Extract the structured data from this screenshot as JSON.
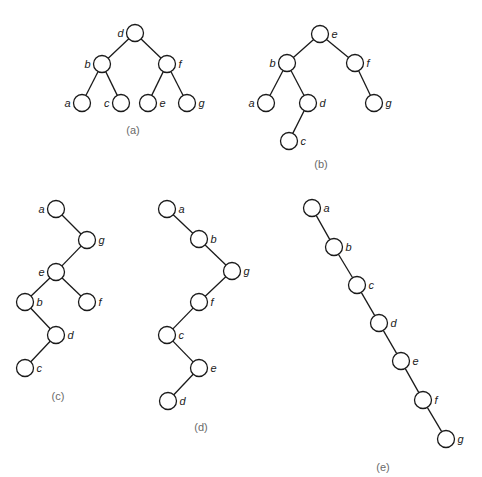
{
  "figure": {
    "node_radius": 8.5,
    "stroke_color": "#1a1a1a",
    "caption_color": "#6a6a6a",
    "trees": [
      {
        "id": "a",
        "caption": "(a)",
        "caption_pos": [
          133,
          134
        ],
        "nodes": [
          {
            "key": "d",
            "x": 135,
            "y": 33,
            "label_side": "left"
          },
          {
            "key": "b",
            "x": 102,
            "y": 64,
            "label_side": "left"
          },
          {
            "key": "f",
            "x": 167,
            "y": 64,
            "label_side": "right"
          },
          {
            "key": "a",
            "x": 82,
            "y": 103,
            "label_side": "left"
          },
          {
            "key": "c",
            "x": 121,
            "y": 103,
            "label_side": "left"
          },
          {
            "key": "e",
            "x": 148,
            "y": 103,
            "label_side": "right"
          },
          {
            "key": "g",
            "x": 187,
            "y": 103,
            "label_side": "right"
          }
        ],
        "edges": [
          [
            "d",
            "b"
          ],
          [
            "d",
            "f"
          ],
          [
            "b",
            "a"
          ],
          [
            "b",
            "c"
          ],
          [
            "f",
            "e"
          ],
          [
            "f",
            "g"
          ]
        ]
      },
      {
        "id": "b",
        "caption": "(b)",
        "caption_pos": [
          321,
          168
        ],
        "nodes": [
          {
            "key": "e",
            "x": 320,
            "y": 34,
            "label_side": "right"
          },
          {
            "key": "b",
            "x": 287,
            "y": 63,
            "label_side": "left"
          },
          {
            "key": "f",
            "x": 355,
            "y": 63,
            "label_side": "right"
          },
          {
            "key": "a",
            "x": 266,
            "y": 103,
            "label_side": "left"
          },
          {
            "key": "d",
            "x": 308,
            "y": 103,
            "label_side": "right"
          },
          {
            "key": "g",
            "x": 374,
            "y": 103,
            "label_side": "right"
          },
          {
            "key": "c",
            "x": 289,
            "y": 141,
            "label_side": "right"
          }
        ],
        "edges": [
          [
            "e",
            "b"
          ],
          [
            "e",
            "f"
          ],
          [
            "b",
            "a"
          ],
          [
            "b",
            "d"
          ],
          [
            "d",
            "c"
          ],
          [
            "f",
            "g"
          ]
        ]
      },
      {
        "id": "c",
        "caption": "(c)",
        "caption_pos": [
          58,
          400
        ],
        "nodes": [
          {
            "key": "a",
            "x": 56,
            "y": 209,
            "label_side": "left"
          },
          {
            "key": "g",
            "x": 87,
            "y": 240,
            "label_side": "right"
          },
          {
            "key": "e",
            "x": 56,
            "y": 272,
            "label_side": "left"
          },
          {
            "key": "b",
            "x": 25,
            "y": 302,
            "label_side": "right"
          },
          {
            "key": "f",
            "x": 87,
            "y": 302,
            "label_side": "right"
          },
          {
            "key": "d",
            "x": 56,
            "y": 335,
            "label_side": "right"
          },
          {
            "key": "c",
            "x": 25,
            "y": 368,
            "label_side": "right"
          }
        ],
        "edges": [
          [
            "a",
            "g"
          ],
          [
            "g",
            "e"
          ],
          [
            "e",
            "b"
          ],
          [
            "e",
            "f"
          ],
          [
            "b",
            "d"
          ],
          [
            "d",
            "c"
          ]
        ]
      },
      {
        "id": "d",
        "caption": "(d)",
        "caption_pos": [
          201,
          431
        ],
        "nodes": [
          {
            "key": "a",
            "x": 167,
            "y": 209,
            "label_side": "right"
          },
          {
            "key": "b",
            "x": 199,
            "y": 239,
            "label_side": "right"
          },
          {
            "key": "g",
            "x": 232,
            "y": 271,
            "label_side": "right"
          },
          {
            "key": "f",
            "x": 199,
            "y": 302,
            "label_side": "right"
          },
          {
            "key": "c",
            "x": 167,
            "y": 335,
            "label_side": "right"
          },
          {
            "key": "e",
            "x": 199,
            "y": 368,
            "label_side": "right"
          },
          {
            "key": "d",
            "x": 168,
            "y": 401,
            "label_side": "right"
          }
        ],
        "edges": [
          [
            "a",
            "b"
          ],
          [
            "b",
            "g"
          ],
          [
            "g",
            "f"
          ],
          [
            "f",
            "c"
          ],
          [
            "c",
            "e"
          ],
          [
            "e",
            "d"
          ]
        ]
      },
      {
        "id": "e",
        "caption": "(e)",
        "caption_pos": [
          383,
          471
        ],
        "nodes": [
          {
            "key": "a",
            "x": 312,
            "y": 208,
            "label_side": "right"
          },
          {
            "key": "b",
            "x": 334,
            "y": 247,
            "label_side": "right"
          },
          {
            "key": "c",
            "x": 357,
            "y": 285,
            "label_side": "right"
          },
          {
            "key": "d",
            "x": 379,
            "y": 323,
            "label_side": "right"
          },
          {
            "key": "e",
            "x": 401,
            "y": 361,
            "label_side": "right"
          },
          {
            "key": "f",
            "x": 423,
            "y": 400,
            "label_side": "right"
          },
          {
            "key": "g",
            "x": 446,
            "y": 439,
            "label_side": "right"
          }
        ],
        "edges": [
          [
            "a",
            "b"
          ],
          [
            "b",
            "c"
          ],
          [
            "c",
            "d"
          ],
          [
            "d",
            "e"
          ],
          [
            "e",
            "f"
          ],
          [
            "f",
            "g"
          ]
        ]
      }
    ]
  }
}
